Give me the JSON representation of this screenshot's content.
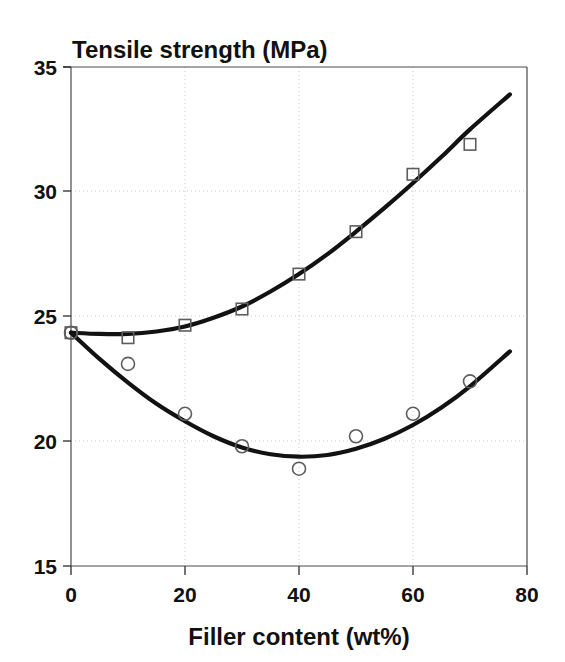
{
  "chart_data": {
    "type": "scatter",
    "title": "Tensile strength (MPa)",
    "xlabel": "Filler content (wt%)",
    "ylabel": "Tensile strength (MPa)",
    "xlim": [
      0,
      80
    ],
    "ylim": [
      15,
      35
    ],
    "xticks": [
      0,
      20,
      40,
      60,
      80
    ],
    "yticks": [
      15,
      20,
      25,
      30,
      35
    ],
    "xtick_labels": [
      "0",
      "20",
      "40",
      "60",
      "80"
    ],
    "ytick_labels": [
      "15",
      "20",
      "25",
      "30",
      "35"
    ],
    "grid": true,
    "legend": null,
    "series": [
      {
        "name": "upper-series-squares",
        "marker": "open-square",
        "x": [
          0,
          10,
          20,
          30,
          40,
          50,
          60,
          70
        ],
        "values": [
          24.35,
          24.15,
          24.65,
          25.3,
          26.7,
          28.4,
          30.7,
          31.9
        ],
        "fit_curve": {
          "x": [
            0,
            5,
            10,
            15,
            20,
            25,
            30,
            35,
            40,
            45,
            50,
            55,
            60,
            65,
            70,
            77
          ],
          "y": [
            24.35,
            24.3,
            24.3,
            24.4,
            24.6,
            24.95,
            25.4,
            26.0,
            26.7,
            27.5,
            28.4,
            29.35,
            30.35,
            31.4,
            32.5,
            33.9
          ]
        }
      },
      {
        "name": "lower-series-circles",
        "marker": "open-circle",
        "x": [
          0,
          10,
          20,
          30,
          40,
          50,
          60,
          70
        ],
        "values": [
          24.35,
          23.1,
          21.1,
          19.8,
          18.9,
          20.2,
          21.1,
          22.4
        ],
        "fit_curve": {
          "x": [
            0,
            5,
            10,
            15,
            20,
            25,
            30,
            35,
            40,
            45,
            50,
            55,
            60,
            65,
            70,
            77
          ],
          "y": [
            24.35,
            23.3,
            22.35,
            21.5,
            20.8,
            20.2,
            19.75,
            19.48,
            19.38,
            19.45,
            19.7,
            20.1,
            20.65,
            21.35,
            22.2,
            23.6
          ]
        }
      }
    ],
    "colors": {
      "curve": "#121212",
      "marker_stroke": "#5d5d5d",
      "grid": "#c9c9c9",
      "frame": "#4a4a4a",
      "text": "#111111",
      "background": "#ffffff"
    }
  }
}
